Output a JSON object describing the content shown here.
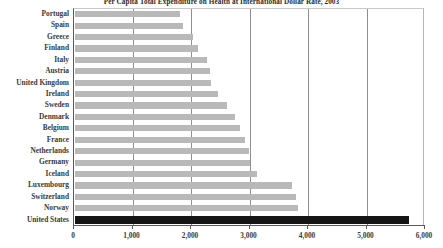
{
  "chart_data": {
    "type": "bar",
    "orientation": "horizontal",
    "title": "Per Capita Total Expenditure on Health at International Dollar Rate, 2003",
    "xlabel": "",
    "ylabel": "",
    "xlim": [
      0,
      6000
    ],
    "xticks": [
      0,
      1000,
      2000,
      3000,
      4000,
      5000,
      6000
    ],
    "xticklabels": [
      "0",
      "1,000",
      "2,000",
      "3,000",
      "4,000",
      "5,000",
      "6,000"
    ],
    "grid": true,
    "grid_axis": "x",
    "legend": false,
    "bar_color": "#b9b9b9",
    "highlight_color": "#151515",
    "highlight_category": "United States",
    "categories": [
      "Portugal",
      "Spain",
      "Greece",
      "Finland",
      "Italy",
      "Austria",
      "United Kingdom",
      "Ireland",
      "Sweden",
      "Denmark",
      "Belgium",
      "France",
      "Netherlands",
      "Germany",
      "Iceland",
      "Luxembourg",
      "Switzerland",
      "Norway",
      "United States"
    ],
    "values": [
      1797,
      1853,
      2011,
      2104,
      2258,
      2306,
      2317,
      2451,
      2594,
      2743,
      2828,
      2902,
      2976,
      2996,
      3115,
      3705,
      3781,
      3807,
      5711
    ]
  }
}
